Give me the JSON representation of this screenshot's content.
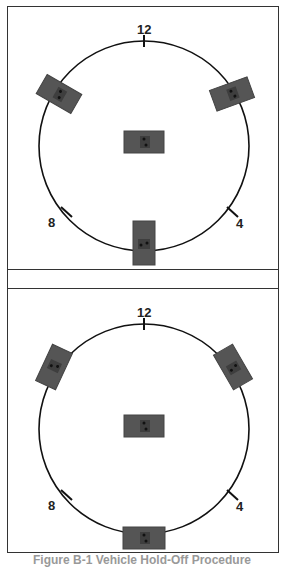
{
  "figure": {
    "caption": "Figure B-1 Vehicle Hold-Off Procedure",
    "panels": [
      {
        "id": "top",
        "clock_labels": {
          "twelve": "12",
          "eight": "8",
          "four": "4"
        },
        "circle": {
          "cx": 136,
          "cy": 139,
          "r": 105
        },
        "vehicles": [
          {
            "name": "center",
            "x": 136,
            "y": 135,
            "angle": 0
          },
          {
            "name": "upper-left",
            "x": 51,
            "y": 87,
            "angle": 30
          },
          {
            "name": "upper-right",
            "x": 224,
            "y": 87,
            "angle": -20
          },
          {
            "name": "bottom",
            "x": 136,
            "y": 236,
            "angle": 90
          }
        ]
      },
      {
        "id": "bottom",
        "clock_labels": {
          "twelve": "12",
          "eight": "8",
          "four": "4"
        },
        "circle": {
          "cx": 136,
          "cy": 140,
          "r": 105
        },
        "vehicles": [
          {
            "name": "center",
            "x": 136,
            "y": 137,
            "angle": 0
          },
          {
            "name": "upper-left",
            "x": 46,
            "y": 78,
            "angle": -65
          },
          {
            "name": "upper-right",
            "x": 225,
            "y": 78,
            "angle": 60
          },
          {
            "name": "bottom",
            "x": 136,
            "y": 249,
            "angle": 0
          }
        ]
      }
    ],
    "colors": {
      "line": "#111111",
      "vehicle": "#555555",
      "vehicle_dark": "#3e3e3e",
      "border": "#333333"
    }
  }
}
